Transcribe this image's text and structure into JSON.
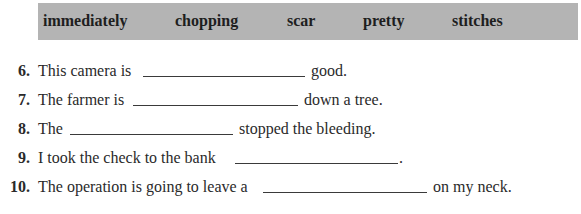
{
  "word_bank": {
    "words": [
      "immediately",
      "chopping",
      "scar",
      "pretty",
      "stitches"
    ],
    "background_color": "#b4b4b4"
  },
  "items": [
    {
      "number": "6.",
      "before": "This camera is",
      "after": "good.",
      "answer": ""
    },
    {
      "number": "7.",
      "before": "The farmer is",
      "after": "down a tree.",
      "answer": ""
    },
    {
      "number": "8.",
      "before": "The",
      "after": "stopped the bleeding.",
      "answer": ""
    },
    {
      "number": "9.",
      "before": "I took the check to the bank",
      "after": ".",
      "answer": ""
    },
    {
      "number": "10.",
      "before": "The operation is going to leave a",
      "after": "on my neck.",
      "answer": ""
    }
  ]
}
